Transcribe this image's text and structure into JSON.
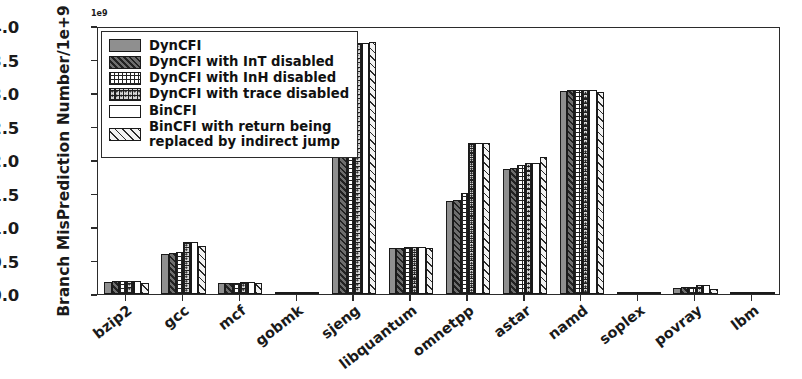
{
  "chart_data": {
    "type": "bar",
    "title": "",
    "xlabel": "",
    "ylabel": "Branch MisPrediction Number/1e+9",
    "exponent": "1e9",
    "ylim": [
      0.0,
      4.0
    ],
    "ytick_labels": [
      "0.0",
      "0.5",
      "1.0",
      "1.5",
      "2.0",
      "2.5",
      "3.0",
      "3.5",
      "4.0"
    ],
    "ytick_values": [
      0.0,
      0.5,
      1.0,
      1.5,
      2.0,
      2.5,
      3.0,
      3.5,
      4.0
    ],
    "grid": false,
    "legend_position": "upper left",
    "categories": [
      "bzip2",
      "gcc",
      "mcf",
      "gobmk",
      "sjeng",
      "libquantum",
      "omnetpp",
      "astar",
      "namd",
      "soplex",
      "povray",
      "lbm"
    ],
    "series": [
      {
        "name": "DynCFI",
        "pattern": "solid-gray",
        "values": [
          0.18,
          0.6,
          0.17,
          0.02,
          3.7,
          0.69,
          1.39,
          1.86,
          3.03,
          0.03,
          0.09,
          0.03
        ]
      },
      {
        "name": "DynCFI with InT disabled",
        "pattern": "dark-diagonal-hatch",
        "values": [
          0.19,
          0.61,
          0.17,
          0.02,
          3.72,
          0.69,
          1.41,
          1.88,
          3.04,
          0.03,
          0.1,
          0.03
        ]
      },
      {
        "name": "DynCFI with InH disabled",
        "pattern": "cross-grid-hatch",
        "values": [
          0.19,
          0.63,
          0.17,
          0.02,
          3.73,
          0.7,
          1.51,
          1.92,
          3.05,
          0.03,
          0.11,
          0.03
        ]
      },
      {
        "name": "DynCFI with trace disabled",
        "pattern": "dotted-grid-hatch",
        "values": [
          0.2,
          0.77,
          0.18,
          0.02,
          3.74,
          0.7,
          2.26,
          1.96,
          3.05,
          0.03,
          0.13,
          0.03
        ]
      },
      {
        "name": "BinCFI",
        "pattern": "plain-white",
        "values": [
          0.2,
          0.77,
          0.18,
          0.02,
          3.75,
          0.7,
          2.26,
          1.96,
          3.05,
          0.03,
          0.13,
          0.03
        ]
      },
      {
        "name": "BinCFI with return being\nreplaced by indirect jump",
        "pattern": "light-diagonal-hatch",
        "values": [
          0.17,
          0.72,
          0.16,
          0.01,
          3.76,
          0.69,
          2.25,
          2.05,
          3.02,
          0.02,
          0.07,
          0.02
        ]
      }
    ]
  }
}
